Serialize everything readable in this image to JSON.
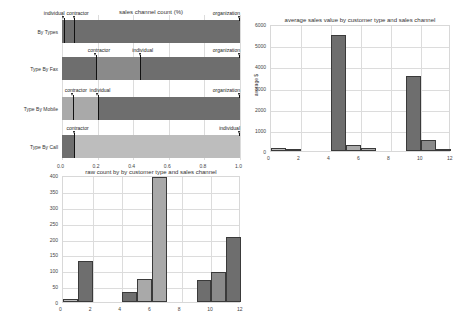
{
  "colors": {
    "dark": "#6e6e6e",
    "mid": "#8a8a8a",
    "light": "#a9a9a9",
    "lighter": "#bdbdbd",
    "grid": "#dcdcdc"
  },
  "chart_data": [
    {
      "type": "bar",
      "orientation": "horizontal",
      "stacked": true,
      "title": "sales channel count (%)",
      "xlabel": "",
      "ylabel": "",
      "xlim": [
        0.0,
        1.0
      ],
      "xticks": [
        "0.0",
        "0.2",
        "0.4",
        "0.6",
        "0.8",
        "1.0"
      ],
      "categories": [
        "By Types",
        "Type By Fax",
        "Type By Mobile",
        "Type By Call"
      ],
      "rows": [
        {
          "label": "By Types",
          "segments": [
            {
              "name": "individual",
              "start": 0.0,
              "end": 0.01,
              "color": "dark"
            },
            {
              "name": "contractor",
              "start": 0.01,
              "end": 0.07,
              "color": "dark"
            },
            {
              "name": "organization",
              "start": 0.07,
              "end": 1.0,
              "color": "dark"
            }
          ],
          "markers": [
            {
              "label": "individual",
              "x": 0.01
            },
            {
              "label": "contractor",
              "x": 0.07
            },
            {
              "label": "organization",
              "x": 1.0
            }
          ]
        },
        {
          "label": "Type By Fax",
          "segments": [
            {
              "name": "contractor",
              "start": 0.0,
              "end": 0.19,
              "color": "dark"
            },
            {
              "name": "individual",
              "start": 0.19,
              "end": 0.44,
              "color": "mid"
            },
            {
              "name": "organization",
              "start": 0.44,
              "end": 1.0,
              "color": "dark"
            }
          ],
          "markers": [
            {
              "label": "contractor",
              "x": 0.19
            },
            {
              "label": "individual",
              "x": 0.44
            },
            {
              "label": "organization",
              "x": 1.0
            }
          ]
        },
        {
          "label": "Type By Mobile",
          "segments": [
            {
              "name": "contractor",
              "start": 0.0,
              "end": 0.06,
              "color": "light"
            },
            {
              "name": "individual",
              "start": 0.06,
              "end": 0.2,
              "color": "light"
            },
            {
              "name": "organization",
              "start": 0.2,
              "end": 1.0,
              "color": "dark"
            }
          ],
          "markers": [
            {
              "label": "contractor",
              "x": 0.06
            },
            {
              "label": "individual",
              "x": 0.2
            },
            {
              "label": "organization",
              "x": 1.0
            }
          ]
        },
        {
          "label": "Type By Call",
          "segments": [
            {
              "name": "contractor",
              "start": 0.0,
              "end": 0.07,
              "color": "dark"
            },
            {
              "name": "individual",
              "start": 0.07,
              "end": 1.0,
              "color": "lighter"
            }
          ],
          "markers": [
            {
              "label": "contractor",
              "x": 0.07
            },
            {
              "label": "individual",
              "x": 1.0
            }
          ]
        }
      ]
    },
    {
      "type": "bar",
      "title": "average sales value by customer type and sales channel",
      "xlabel": "",
      "ylabel": "average $",
      "xlim": [
        0,
        12
      ],
      "ylim": [
        0,
        6000
      ],
      "xticks": [
        "0",
        "2",
        "4",
        "6",
        "8",
        "10",
        "12"
      ],
      "yticks": [
        "0",
        "1000",
        "2000",
        "3000",
        "4000",
        "5000",
        "6000"
      ],
      "bars": [
        {
          "x0": 0,
          "x1": 1,
          "value": 150,
          "color": "lighter"
        },
        {
          "x0": 1,
          "x1": 2,
          "value": 30,
          "color": "dark"
        },
        {
          "x0": 4,
          "x1": 5,
          "value": 5500,
          "color": "dark"
        },
        {
          "x0": 5,
          "x1": 6,
          "value": 270,
          "color": "light"
        },
        {
          "x0": 6,
          "x1": 7,
          "value": 130,
          "color": "light"
        },
        {
          "x0": 9,
          "x1": 10,
          "value": 3550,
          "color": "dark"
        },
        {
          "x0": 10,
          "x1": 11,
          "value": 500,
          "color": "mid"
        },
        {
          "x0": 11,
          "x1": 12,
          "value": 60,
          "color": "dark"
        }
      ]
    },
    {
      "type": "bar",
      "title": "raw count by by customer type and sales channel",
      "xlabel": "",
      "ylabel": "",
      "xlim": [
        0,
        12
      ],
      "ylim": [
        0,
        400
      ],
      "xticks": [
        "0",
        "2",
        "4",
        "6",
        "8",
        "10",
        "12"
      ],
      "yticks": [
        "0",
        "50",
        "100",
        "150",
        "200",
        "250",
        "300",
        "350",
        "400"
      ],
      "bars": [
        {
          "x0": 0,
          "x1": 1,
          "value": 10,
          "color": "lighter"
        },
        {
          "x0": 1,
          "x1": 2,
          "value": 130,
          "color": "dark"
        },
        {
          "x0": 4,
          "x1": 5,
          "value": 33,
          "color": "dark"
        },
        {
          "x0": 5,
          "x1": 6,
          "value": 73,
          "color": "light"
        },
        {
          "x0": 6,
          "x1": 7,
          "value": 395,
          "color": "light"
        },
        {
          "x0": 9,
          "x1": 10,
          "value": 70,
          "color": "dark"
        },
        {
          "x0": 10,
          "x1": 11,
          "value": 93,
          "color": "mid"
        },
        {
          "x0": 11,
          "x1": 12,
          "value": 205,
          "color": "dark"
        }
      ]
    }
  ]
}
